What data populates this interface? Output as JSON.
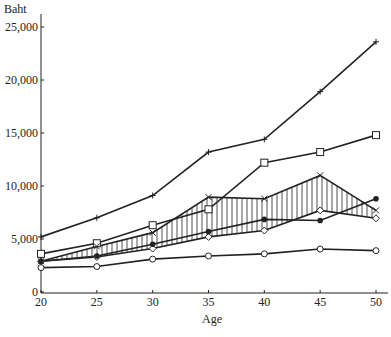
{
  "chart_data": {
    "type": "line",
    "title": "",
    "xlabel": "Age",
    "ylabel": "Baht",
    "x": [
      20,
      25,
      30,
      35,
      40,
      45,
      50
    ],
    "xlim": [
      20,
      50
    ],
    "ylim": [
      0,
      25000
    ],
    "x_ticks": [
      "20",
      "25",
      "30",
      "35",
      "40",
      "45",
      "50"
    ],
    "y_ticks": [
      "0",
      "5,000",
      "10,000",
      "15,000",
      "20,000",
      "25,000"
    ],
    "y_tick_values": [
      0,
      5000,
      10000,
      15000,
      20000,
      25000
    ],
    "grid": false,
    "legend": null,
    "series": [
      {
        "name": "plus-marker series",
        "marker": "plus",
        "values": [
          5200,
          7000,
          9100,
          13200,
          14400,
          18900,
          23600
        ]
      },
      {
        "name": "open-square series",
        "marker": "square",
        "values": [
          3600,
          4600,
          6300,
          7800,
          12200,
          13200,
          14800
        ]
      },
      {
        "name": "hatched band upper",
        "marker": "x",
        "values": [
          2900,
          4300,
          5600,
          8950,
          8800,
          11000,
          7700
        ]
      },
      {
        "name": "hatched band lower",
        "marker": "diamond",
        "values": [
          2900,
          3300,
          4100,
          5200,
          5800,
          7700,
          6950
        ]
      },
      {
        "name": "filled-circle series",
        "marker": "filled-circle",
        "values": [
          2900,
          3400,
          4500,
          5700,
          6850,
          6750,
          8800
        ]
      },
      {
        "name": "open-circle series",
        "marker": "circle",
        "values": [
          2300,
          2400,
          3100,
          3400,
          3600,
          4050,
          3900
        ]
      }
    ],
    "shaded_band": {
      "between": [
        "hatched band upper",
        "hatched band lower"
      ],
      "style": "vertical hatching"
    }
  }
}
